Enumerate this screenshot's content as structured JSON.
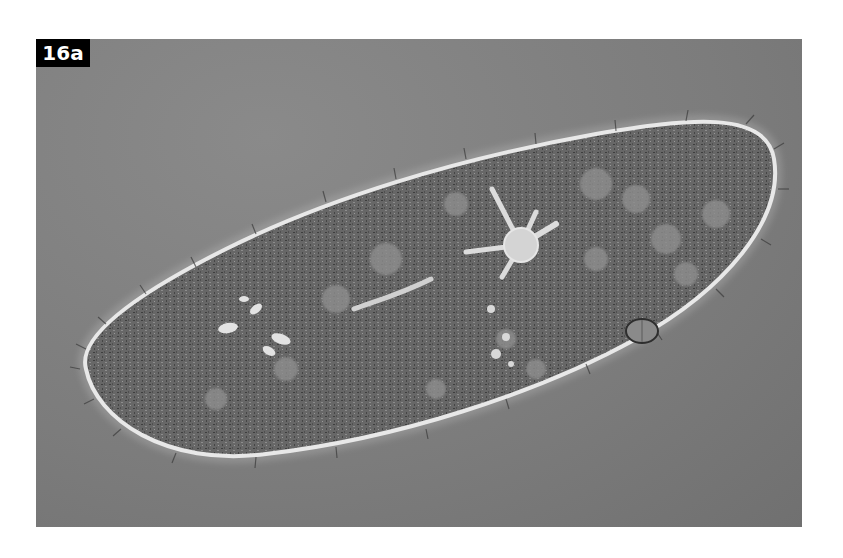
{
  "figure": {
    "label": "16a",
    "colors": {
      "background": "#7c7c7c",
      "label_bg": "#000000",
      "label_text": "#ffffff",
      "cell_outline": "#e6e6e6",
      "cell_body": "#6a6a6a"
    }
  }
}
